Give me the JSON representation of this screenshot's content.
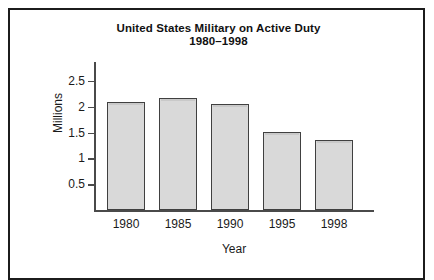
{
  "figure": {
    "title_line1": "United States Military on Active Duty",
    "title_line2": "1980–1998",
    "frame_color": "#1c1c1c",
    "bar_fill_color": "#d9d9d9",
    "bar_border_color": "#404040",
    "axis_color": "#4a4a4a",
    "text_color": "#1a1a1a"
  },
  "chart_data": {
    "type": "bar",
    "title": "United States Military on Active Duty 1980–1998",
    "subtitle": "1980–1998",
    "xlabel": "Year",
    "ylabel": "Millions",
    "categories": [
      "1980",
      "1985",
      "1990",
      "1995",
      "1998"
    ],
    "values": [
      2.09,
      2.17,
      2.06,
      1.52,
      1.35
    ],
    "ylim": [
      0,
      2.75
    ],
    "yticks": [
      0.5,
      1,
      1.5,
      2,
      2.5
    ],
    "ytick_labels": [
      "0.5",
      "1",
      "1.5",
      "2",
      "2.5"
    ],
    "grid": false,
    "legend": null,
    "legend_position": "none",
    "bar_fill": "#d9d9d9",
    "bar_edge": "#404040"
  }
}
